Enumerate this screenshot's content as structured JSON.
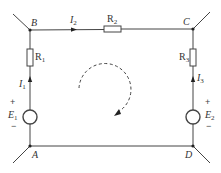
{
  "diagram": {
    "type": "circuit",
    "nodes": {
      "B": {
        "label": "B"
      },
      "C": {
        "label": "C"
      },
      "A": {
        "label": "A"
      },
      "D": {
        "label": "D"
      }
    },
    "resistors": {
      "R1": {
        "label": "R",
        "sub": "1"
      },
      "R2": {
        "label": "R",
        "sub": "2"
      },
      "R3": {
        "label": "R",
        "sub": "3"
      }
    },
    "currents": {
      "I1": {
        "label": "I",
        "sub": "1"
      },
      "I2": {
        "label": "I",
        "sub": "2"
      },
      "I3": {
        "label": "I",
        "sub": "3"
      }
    },
    "sources": {
      "E1": {
        "label": "E",
        "sub": "1",
        "plus": "+",
        "minus": "−"
      },
      "E2": {
        "label": "E",
        "sub": "2",
        "plus": "+",
        "minus": "−"
      }
    },
    "loop_direction": "clockwise",
    "colors": {
      "wire": "#444444",
      "background": "#ffffff"
    }
  }
}
